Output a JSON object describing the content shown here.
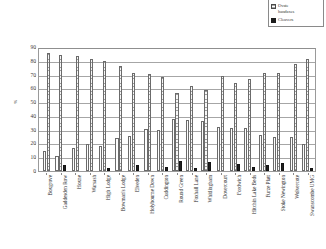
{
  "legend": {
    "position": "top-right",
    "entries": [
      {
        "label_line1": "Pointed",
        "label_line2": "handaxes",
        "swatch": "white-outline-bar",
        "name": "Pointed handaxes"
      },
      {
        "label_line1": "Ovate",
        "label_line2": "handaxes",
        "swatch": "hatched-gray-bar",
        "name": "Ovate handaxes"
      },
      {
        "label_line1": "Cleavers",
        "label_line2": "",
        "swatch": "solid-black-bar",
        "name": "Cleavers"
      }
    ]
  },
  "axis": {
    "ylabel": "%",
    "yticks": [
      "0",
      "10",
      "20",
      "30",
      "40",
      "50",
      "60",
      "70",
      "80",
      "90"
    ]
  },
  "chart_data": {
    "type": "bar",
    "title": "",
    "subtitle": "",
    "xlabel": "",
    "ylabel": "%",
    "ylim": [
      0,
      90
    ],
    "ytick_step": 10,
    "grid": true,
    "legend_position": "top-right",
    "categories": [
      "Boxgrove",
      "Gaddesden Row",
      "Hoxne",
      "Warsash",
      "High Lodge",
      "Bowman's Lodge",
      "Elveden",
      "Holybourne Down",
      "Cuddington",
      "Round Green",
      "Foxhall Lane",
      "Whitlingham",
      "Dovercourt",
      "Fordwich",
      "Hitchin Lake Beds",
      "Furze Platt",
      "Stoke Newington",
      "Wolvercote",
      "Swanscombe UMG"
    ],
    "series": [
      {
        "name": "Pointed handaxes",
        "values": [
          14.5,
          11.0,
          17.0,
          19.5,
          18.0,
          24.0,
          25.5,
          30.5,
          29.5,
          38.0,
          37.0,
          36.0,
          32.0,
          31.5,
          31.5,
          26.5,
          24.5,
          24.5,
          19.5
        ]
      },
      {
        "name": "Ovate handaxes",
        "values": [
          85.5,
          84.5,
          83.5,
          81.5,
          79.5,
          76.0,
          71.0,
          70.5,
          68.5,
          56.5,
          61.5,
          59.0,
          69.0,
          64.0,
          67.0,
          71.5,
          71.0,
          77.5,
          81.5
        ]
      },
      {
        "name": "Cleavers",
        "values": [
          0,
          4.5,
          0,
          0,
          2.0,
          0,
          4.5,
          0,
          3.0,
          7.0,
          2.5,
          6.5,
          0,
          5.0,
          3.0,
          4.5,
          6.0,
          0,
          2.0
        ]
      }
    ]
  }
}
